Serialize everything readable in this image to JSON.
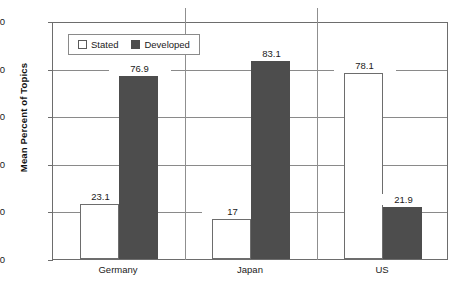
{
  "chart_data": {
    "type": "bar",
    "title": "",
    "xlabel": "",
    "ylabel": "Mean Percent of Topics",
    "categories": [
      "Germany",
      "Japan",
      "US"
    ],
    "series": [
      {
        "name": "Stated",
        "values": [
          23.1,
          17,
          78.1
        ],
        "labels": [
          "23.1",
          "17",
          "78.1"
        ],
        "color": "#ffffff"
      },
      {
        "name": "Developed",
        "values": [
          76.9,
          83.1,
          21.9
        ],
        "labels": [
          "76.9",
          "83.1",
          "21.9"
        ],
        "color": "#4d4d4d"
      }
    ],
    "ylim": [
      0,
      100
    ],
    "yticks": [
      0,
      20,
      40,
      60,
      80,
      100
    ],
    "ytick_labels": [
      "0",
      "20",
      "40",
      "60",
      "80",
      "100"
    ],
    "grid": "horizontal",
    "legend_position": "top-left-inside"
  },
  "legend": {
    "items": [
      {
        "label": "Stated",
        "swatch": "open-square-icon"
      },
      {
        "label": "Developed",
        "swatch": "filled-square-icon"
      }
    ]
  },
  "axis": {
    "y_title": "Mean Percent of Topics"
  }
}
